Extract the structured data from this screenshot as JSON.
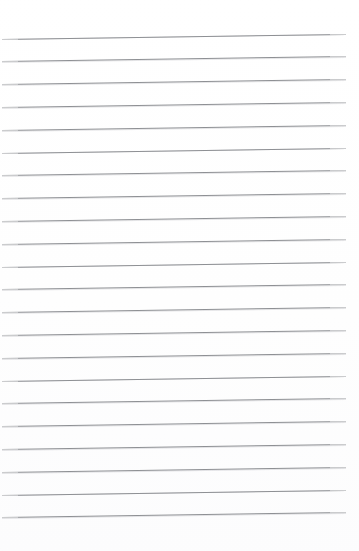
{
  "document": {
    "kind": "lined-paper-scan",
    "description": "Blank ruled notepad page",
    "page_width": 359,
    "page_height": 551,
    "background_color": "#ffffff",
    "rule_color": "#8e9094",
    "rule_thickness_px": 1,
    "text_content": "",
    "visible_text": ""
  },
  "ruling": {
    "line_count": 22,
    "first_line_y": 38.5,
    "line_spacing_px": 22.8,
    "line_start_x": 2,
    "line_end_x": 346,
    "line_length_px": 344,
    "skew_degrees": -0.83,
    "rise_px_over_span": 5,
    "top_margin_px": 38,
    "bottom_margin_px": 28,
    "left_margin_px": 2,
    "right_margin_px": 13
  },
  "lines": [
    {
      "index": 1,
      "y": 38.5,
      "label": "rule-1"
    },
    {
      "index": 2,
      "y": 61.3,
      "label": "rule-2"
    },
    {
      "index": 3,
      "y": 84.1,
      "label": "rule-3"
    },
    {
      "index": 4,
      "y": 106.9,
      "label": "rule-4"
    },
    {
      "index": 5,
      "y": 129.7,
      "label": "rule-5"
    },
    {
      "index": 6,
      "y": 152.5,
      "label": "rule-6"
    },
    {
      "index": 7,
      "y": 175.3,
      "label": "rule-7"
    },
    {
      "index": 8,
      "y": 198.1,
      "label": "rule-8"
    },
    {
      "index": 9,
      "y": 220.9,
      "label": "rule-9"
    },
    {
      "index": 10,
      "y": 243.7,
      "label": "rule-10"
    },
    {
      "index": 11,
      "y": 266.5,
      "label": "rule-11"
    },
    {
      "index": 12,
      "y": 289.3,
      "label": "rule-12"
    },
    {
      "index": 13,
      "y": 312.1,
      "label": "rule-13"
    },
    {
      "index": 14,
      "y": 334.9,
      "label": "rule-14"
    },
    {
      "index": 15,
      "y": 357.7,
      "label": "rule-15"
    },
    {
      "index": 16,
      "y": 380.5,
      "label": "rule-16"
    },
    {
      "index": 17,
      "y": 403.3,
      "label": "rule-17"
    },
    {
      "index": 18,
      "y": 426.1,
      "label": "rule-18"
    },
    {
      "index": 19,
      "y": 448.9,
      "label": "rule-19"
    },
    {
      "index": 20,
      "y": 471.7,
      "label": "rule-20"
    },
    {
      "index": 21,
      "y": 494.5,
      "label": "rule-21"
    },
    {
      "index": 22,
      "y": 517.3,
      "label": "rule-22"
    }
  ]
}
